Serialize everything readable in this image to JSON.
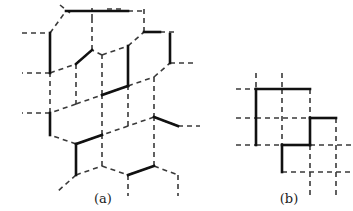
{
  "figure": {
    "type": "lattice-diagram",
    "background_color": "#ffffff",
    "dashed_color": "#3a3a3a",
    "solid_color": "#111111",
    "dashed_width": 1.6,
    "solid_width": 2.6,
    "dash_pattern": "5,4",
    "panels": [
      {
        "id": "a",
        "label": "(a)",
        "lattice": "hexagonal",
        "description": "honeycomb lattice drawn with dashed edges, a subset of edges drawn bold solid forming a perfect matching (dimer cover)"
      },
      {
        "id": "b",
        "label": "(b)",
        "lattice": "square",
        "description": "square lattice drawn with dashed edges, a subset of edges drawn bold solid forming a staircase contour"
      }
    ],
    "panel_a": {
      "dashed_edges": [
        [
          22,
          33,
          50,
          33
        ],
        [
          50,
          33,
          66,
          11
        ],
        [
          50,
          33,
          50,
          73
        ],
        [
          66,
          11,
          80,
          11
        ],
        [
          80,
          11,
          96,
          11
        ],
        [
          96,
          11,
          112,
          11
        ],
        [
          112,
          11,
          128,
          11
        ],
        [
          128,
          11,
          144,
          11
        ],
        [
          107,
          9,
          122,
          9
        ],
        [
          50,
          73,
          22,
          73
        ],
        [
          50,
          73,
          76,
          64
        ],
        [
          76,
          64,
          92,
          50
        ],
        [
          92,
          50,
          92,
          19
        ],
        [
          92,
          19,
          92,
          8
        ],
        [
          76,
          64,
          76,
          104
        ],
        [
          76,
          104,
          50,
          113
        ],
        [
          50,
          113,
          50,
          73
        ],
        [
          50,
          113,
          22,
          113
        ],
        [
          76,
          104,
          102,
          95
        ],
        [
          102,
          95,
          102,
          55
        ],
        [
          102,
          55,
          92,
          50
        ],
        [
          102,
          55,
          128,
          46
        ],
        [
          128,
          46,
          144,
          32
        ],
        [
          144,
          32,
          144,
          8
        ],
        [
          144,
          32,
          160,
          32
        ],
        [
          160,
          32,
          178,
          32
        ],
        [
          128,
          46,
          128,
          86
        ],
        [
          128,
          86,
          102,
          95
        ],
        [
          128,
          86,
          154,
          77
        ],
        [
          154,
          77,
          170,
          63
        ],
        [
          170,
          63,
          170,
          34
        ],
        [
          170,
          63,
          196,
          63
        ],
        [
          154,
          77,
          154,
          117
        ],
        [
          154,
          117,
          128,
          126
        ],
        [
          128,
          126,
          128,
          86
        ],
        [
          128,
          126,
          102,
          135
        ],
        [
          102,
          135,
          102,
          95
        ],
        [
          102,
          135,
          76,
          144
        ],
        [
          76,
          144,
          50,
          135
        ],
        [
          50,
          135,
          50,
          113
        ],
        [
          76,
          144,
          76,
          175
        ],
        [
          76,
          175,
          58,
          191
        ],
        [
          76,
          175,
          102,
          166
        ],
        [
          102,
          166,
          102,
          135
        ],
        [
          102,
          166,
          128,
          175
        ],
        [
          128,
          175,
          128,
          196
        ],
        [
          128,
          175,
          154,
          166
        ],
        [
          154,
          166,
          154,
          117
        ],
        [
          154,
          166,
          178,
          175
        ],
        [
          178,
          175,
          178,
          196
        ],
        [
          154,
          117,
          178,
          126
        ],
        [
          178,
          126,
          200,
          126
        ],
        [
          60,
          5,
          70,
          13
        ]
      ],
      "solid_edges": [
        [
          66,
          11,
          128,
          11
        ],
        [
          50,
          33,
          50,
          73
        ],
        [
          76,
          64,
          92,
          50
        ],
        [
          50,
          113,
          50,
          135
        ],
        [
          102,
          95,
          128,
          86
        ],
        [
          144,
          32,
          160,
          32
        ],
        [
          128,
          46,
          128,
          86
        ],
        [
          170,
          34,
          170,
          63
        ],
        [
          76,
          144,
          102,
          135
        ],
        [
          76,
          144,
          76,
          175
        ],
        [
          128,
          175,
          154,
          166
        ],
        [
          154,
          117,
          178,
          126
        ]
      ]
    },
    "panel_b": {
      "grid_x": [
        256,
        282,
        310,
        336
      ],
      "grid_y": [
        89,
        118,
        145,
        172
      ],
      "dashed_edges": [
        [
          236,
          89,
          256,
          89
        ],
        [
          256,
          89,
          310,
          89
        ],
        [
          310,
          89,
          310,
          118
        ],
        [
          236,
          118,
          256,
          118
        ],
        [
          256,
          118,
          310,
          118
        ],
        [
          310,
          118,
          336,
          118
        ],
        [
          236,
          145,
          256,
          145
        ],
        [
          256,
          145,
          282,
          145
        ],
        [
          310,
          145,
          352,
          145
        ],
        [
          282,
          172,
          352,
          172
        ],
        [
          256,
          73,
          256,
          89
        ],
        [
          282,
          73,
          282,
          89
        ],
        [
          282,
          89,
          282,
          145
        ],
        [
          310,
          118,
          310,
          172
        ],
        [
          336,
          118,
          336,
          196
        ],
        [
          310,
          172,
          310,
          196
        ],
        [
          282,
          145,
          282,
          172
        ]
      ],
      "solid_edges": [
        [
          256,
          89,
          310,
          89
        ],
        [
          256,
          89,
          256,
          145
        ],
        [
          310,
          118,
          336,
          118
        ],
        [
          310,
          118,
          310,
          145
        ],
        [
          282,
          145,
          310,
          145
        ],
        [
          282,
          145,
          282,
          172
        ]
      ]
    }
  }
}
